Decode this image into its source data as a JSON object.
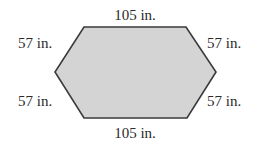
{
  "diagram": {
    "shape": "hexagon",
    "fill_color": "#d4d4d4",
    "stroke_color": "#3a3a3a",
    "vertices": [
      [
        84,
        27
      ],
      [
        186,
        27
      ],
      [
        216,
        72
      ],
      [
        187,
        118
      ],
      [
        84,
        118
      ],
      [
        55,
        72
      ]
    ],
    "labels": {
      "top": "105 in.",
      "bottom": "105 in.",
      "upper_left": "57 in.",
      "upper_right": "57 in.",
      "lower_left": "57 in.",
      "lower_right": "57 in."
    }
  }
}
